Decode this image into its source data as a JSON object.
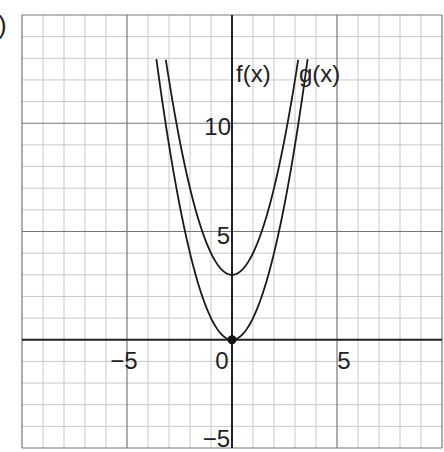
{
  "prefix": ")",
  "chart_data": {
    "type": "line",
    "title": "",
    "xlabel": "",
    "ylabel": "",
    "xlim": [
      -10,
      10
    ],
    "ylim": [
      -5,
      15
    ],
    "grid": true,
    "x_ticks": [
      {
        "value": -5,
        "label": "−5"
      },
      {
        "value": 0,
        "label": "0"
      },
      {
        "value": 5,
        "label": "5"
      }
    ],
    "y_ticks": [
      {
        "value": -5,
        "label": "−5"
      },
      {
        "value": 5,
        "label": "5"
      },
      {
        "value": 10,
        "label": "10"
      }
    ],
    "series": [
      {
        "name": "f(x)",
        "expression": "x^2",
        "vertex": [
          0,
          0
        ],
        "x_range": [
          -3.6,
          3.6
        ]
      },
      {
        "name": "g(x)",
        "expression": "x^2 + 3",
        "vertex": [
          0,
          3
        ],
        "x_range": [
          -3.15,
          3.15
        ]
      }
    ],
    "points": [
      {
        "x": 0,
        "y": 0,
        "label": ""
      }
    ],
    "legend": [
      {
        "text": "f(x)"
      },
      {
        "text": "g(x)"
      }
    ]
  }
}
